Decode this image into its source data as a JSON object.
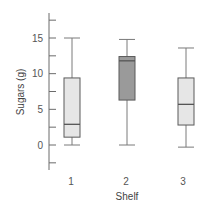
{
  "chart_data": {
    "type": "boxplot",
    "title": "",
    "xlabel": "Shelf",
    "ylabel": "Sugars (g)",
    "categories": [
      "1",
      "2",
      "3"
    ],
    "ylim": [
      -5,
      20
    ],
    "yticks_labeled": [
      0,
      5,
      10,
      15
    ],
    "yticks_minor": [
      -2.5,
      2.5,
      7.5,
      12.5,
      17.5
    ],
    "grid": false,
    "legend": null,
    "boxes": [
      {
        "category": "1",
        "whisker_low": 0,
        "q1": 1.1,
        "median": 2.9,
        "q3": 9.4,
        "whisker_high": 15,
        "fill": "#e6e6e6"
      },
      {
        "category": "2",
        "whisker_low": 0,
        "q1": 6.3,
        "median": 11.8,
        "q3": 12.4,
        "whisker_high": 14.8,
        "fill": "#9a9a9a"
      },
      {
        "category": "3",
        "whisker_low": -0.3,
        "q1": 2.8,
        "median": 5.7,
        "q3": 9.4,
        "whisker_high": 13.6,
        "fill": "#e6e6e6"
      }
    ]
  },
  "colors": {
    "axis": "#6b6b6b",
    "box_stroke": "#5a5a5a",
    "whisker": "#7a7a7a",
    "median": "#555555",
    "light_fill": "#e6e6e6",
    "dark_fill": "#9a9a9a"
  }
}
